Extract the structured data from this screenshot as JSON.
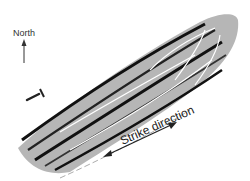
{
  "labels": {
    "north": "North",
    "strike": "Strike direction"
  },
  "icons": {
    "north_arrow": "arrow-up",
    "hammer": "rock-hammer",
    "strike_arrow": "double-headed-arrow"
  },
  "colors": {
    "ink": "#1a1a1a",
    "background": "#ffffff"
  }
}
